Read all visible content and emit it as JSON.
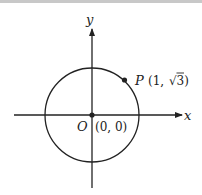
{
  "diagram": {
    "axes": {
      "x_label": "x",
      "y_label": "y"
    },
    "origin": {
      "name": "O",
      "coords": "(0, 0)"
    },
    "point": {
      "name": "P",
      "coords_prefix": "(1, ",
      "coords_root": "3",
      "coords_suffix": ")"
    },
    "circle": {
      "center": "O",
      "passes_through": "P"
    },
    "colors": {
      "stroke": "#222222",
      "background": "#ffffff"
    }
  }
}
